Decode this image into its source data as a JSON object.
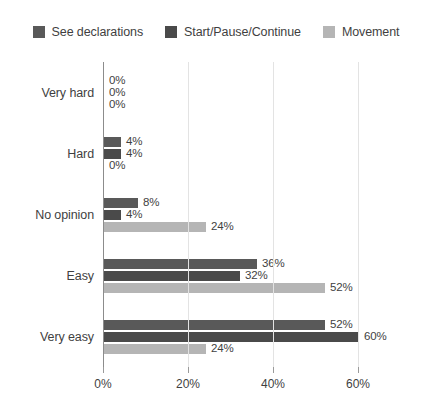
{
  "chart_data": {
    "type": "bar",
    "orientation": "horizontal",
    "title": "",
    "subtitle": "",
    "xlabel": "",
    "ylabel": "",
    "xlim": [
      0,
      64
    ],
    "grid": true,
    "legend_position": "top-center",
    "xticks": [
      "0%",
      "20%",
      "40%",
      "60%"
    ],
    "xtick_values": [
      0,
      20,
      40,
      60
    ],
    "categories": [
      "Very hard",
      "Hard",
      "No opinion",
      "Easy",
      "Very easy"
    ],
    "series": [
      {
        "name": "See declarations",
        "color": "#595959",
        "values": [
          0,
          4,
          8,
          36,
          52
        ],
        "labels": [
          "0%",
          "4%",
          "8%",
          "36%",
          "52%"
        ]
      },
      {
        "name": "Start/Pause/Continue",
        "color": "#4a4a4a",
        "values": [
          0,
          4,
          4,
          32,
          60
        ],
        "labels": [
          "0%",
          "4%",
          "4%",
          "32%",
          "60%"
        ]
      },
      {
        "name": "Movement",
        "color": "#b5b5b5",
        "values": [
          0,
          0,
          24,
          52,
          24
        ],
        "labels": [
          "0%",
          "0%",
          "24%",
          "52%",
          "24%"
        ]
      }
    ]
  },
  "legend": {
    "items": [
      {
        "label": "See declarations",
        "color": "#595959"
      },
      {
        "label": "Start/Pause/Continue",
        "color": "#4a4a4a"
      },
      {
        "label": "Movement",
        "color": "#b5b5b5"
      }
    ]
  },
  "axis": {
    "ticks": [
      {
        "label": "0%",
        "value": 0
      },
      {
        "label": "20%",
        "value": 20
      },
      {
        "label": "40%",
        "value": 40
      },
      {
        "label": "60%",
        "value": 60
      }
    ]
  }
}
